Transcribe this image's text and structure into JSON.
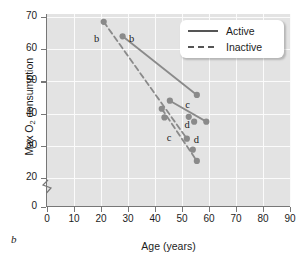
{
  "chart_data": {
    "type": "scatter",
    "title": "",
    "panel_label": "b",
    "xlabel": "Age (years)",
    "ylabel": "Max O2 consumption",
    "ylabel_prefix": "Max O",
    "ylabel_sub": "2",
    "ylabel_suffix": " consumption",
    "xlim": [
      0,
      90
    ],
    "ylim": [
      0,
      70
    ],
    "y_axis_break": true,
    "y_break_between": [
      0,
      20
    ],
    "xticks": [
      0,
      10,
      20,
      30,
      40,
      50,
      60,
      70,
      80,
      90
    ],
    "yticks": [
      0,
      20,
      30,
      40,
      50,
      60,
      70
    ],
    "grid": true,
    "grid_color": "#fbfbfb",
    "plot_background": "#e3e3e3",
    "marker_color": "#8a8a8a",
    "line_color": "#8a8a8a",
    "legend_position": "top-right",
    "series": [
      {
        "name": "Active",
        "style": "solid",
        "points": [
          {
            "x": 28.0,
            "y": 64.0
          },
          {
            "x": 45.5,
            "y": 44.0
          },
          {
            "x": 52.5,
            "y": 39.0
          },
          {
            "x": 54.5,
            "y": 37.5
          },
          {
            "x": 55.5,
            "y": 45.8
          },
          {
            "x": 59.0,
            "y": 37.5
          }
        ],
        "segments": [
          [
            {
              "x": 28.0,
              "y": 64.0
            },
            {
              "x": 55.5,
              "y": 45.8
            }
          ],
          [
            {
              "x": 45.5,
              "y": 44.0
            },
            {
              "x": 59.0,
              "y": 37.5
            }
          ]
        ]
      },
      {
        "name": "Inactive",
        "style": "dashed",
        "points": [
          {
            "x": 21.0,
            "y": 68.5
          },
          {
            "x": 42.5,
            "y": 41.5
          },
          {
            "x": 43.5,
            "y": 38.8
          },
          {
            "x": 51.8,
            "y": 32.2
          },
          {
            "x": 54.0,
            "y": 28.8
          },
          {
            "x": 55.5,
            "y": 25.3
          }
        ],
        "segments": [
          [
            {
              "x": 21.0,
              "y": 68.5
            },
            {
              "x": 51.8,
              "y": 32.2
            }
          ],
          [
            {
              "x": 42.5,
              "y": 41.5
            },
            {
              "x": 55.5,
              "y": 25.3
            }
          ]
        ]
      }
    ],
    "annotations": [
      {
        "text": "b",
        "x": 18.5,
        "y": 63.0
      },
      {
        "text": "b",
        "x": 31.5,
        "y": 63.0
      },
      {
        "text": "c",
        "x": 52.3,
        "y": 42.3
      },
      {
        "text": "c",
        "x": 45.5,
        "y": 32.2
      },
      {
        "text": "d",
        "x": 52.0,
        "y": 36.0
      },
      {
        "text": "d",
        "x": 55.5,
        "y": 31.4
      }
    ]
  },
  "legend": {
    "items": [
      {
        "label": "Active",
        "style": "solid"
      },
      {
        "label": "Inactive",
        "style": "dashed"
      }
    ]
  }
}
